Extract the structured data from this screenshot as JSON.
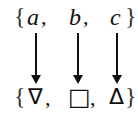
{
  "diagram": {
    "top_set": {
      "open_brace": "{",
      "close_brace": "}",
      "elements": [
        {
          "label": "a",
          "sep": ","
        },
        {
          "label": "b",
          "sep": ","
        },
        {
          "label": "c",
          "sep": ""
        }
      ]
    },
    "bottom_set": {
      "open_brace": "{",
      "close_brace": "}",
      "elements": [
        {
          "label": "∇",
          "sep": ","
        },
        {
          "label": "□",
          "sep": ","
        },
        {
          "label": "Δ",
          "sep": ""
        }
      ]
    },
    "mappings": [
      {
        "from": "a",
        "to": "∇"
      },
      {
        "from": "b",
        "to": "□"
      },
      {
        "from": "c",
        "to": "Δ"
      }
    ]
  }
}
